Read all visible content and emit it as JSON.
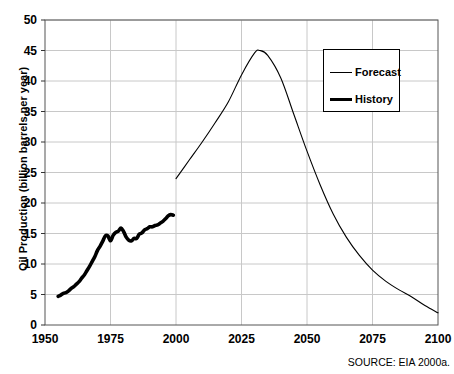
{
  "chart_data": {
    "type": "line",
    "title": "",
    "xlabel": "",
    "ylabel": "Oil Production (billion barrels per year)",
    "xlim": [
      1950,
      2100
    ],
    "ylim": [
      0,
      50
    ],
    "grid": true,
    "xticks": [
      "1950",
      "1975",
      "2000",
      "2025",
      "2050",
      "2075",
      "2100"
    ],
    "yticks": [
      "0",
      "5",
      "10",
      "15",
      "20",
      "25",
      "30",
      "35",
      "40",
      "45",
      "50"
    ],
    "xtick_values": [
      1950,
      1975,
      2000,
      2025,
      2050,
      2075,
      2100
    ],
    "ytick_values": [
      0,
      5,
      10,
      15,
      20,
      25,
      30,
      35,
      40,
      45,
      50
    ],
    "legend_position": "upper right",
    "annotation": "SOURCE: EIA 2000a.",
    "line_color": "#000000",
    "grid_color": "#c8c8c8",
    "axis_color": "#555555",
    "series": [
      {
        "name": "History",
        "style": "thick",
        "width": 3.6,
        "x": [
          1955,
          1956,
          1957,
          1958,
          1959,
          1960,
          1961,
          1962,
          1963,
          1964,
          1965,
          1966,
          1967,
          1968,
          1969,
          1970,
          1971,
          1972,
          1973,
          1974,
          1975,
          1976,
          1977,
          1978,
          1979,
          1980,
          1981,
          1982,
          1983,
          1984,
          1985,
          1986,
          1987,
          1988,
          1989,
          1990,
          1991,
          1992,
          1993,
          1994,
          1995,
          1996,
          1997,
          1998,
          1999
        ],
        "values": [
          4.7,
          4.9,
          5.2,
          5.3,
          5.6,
          6.0,
          6.3,
          6.7,
          7.1,
          7.7,
          8.2,
          8.9,
          9.6,
          10.4,
          11.2,
          12.2,
          12.9,
          13.7,
          14.6,
          14.6,
          13.8,
          14.7,
          15.2,
          15.4,
          15.9,
          15.3,
          14.4,
          13.9,
          13.8,
          14.2,
          14.2,
          14.9,
          15.1,
          15.6,
          15.8,
          16.1,
          16.1,
          16.3,
          16.4,
          16.7,
          17.0,
          17.4,
          17.9,
          18.1,
          18.0
        ],
        "description": "Historical oil production 1955-1999, rising from about 5 to about 24 billion barrels per year, with dips at the 1973-75 and 1979-83 oil shocks."
      },
      {
        "name": "Forecast",
        "style": "thin",
        "width": 1.1,
        "x": [
          2000,
          2005,
          2010,
          2015,
          2020,
          2025,
          2030,
          2032,
          2035,
          2040,
          2045,
          2050,
          2055,
          2060,
          2065,
          2070,
          2075,
          2080,
          2085,
          2090,
          2095,
          2100
        ],
        "values": [
          24.0,
          27.0,
          30.0,
          33.2,
          36.6,
          41.0,
          44.6,
          45.0,
          44.2,
          40.5,
          34.5,
          28.5,
          23.0,
          18.2,
          14.4,
          11.4,
          9.0,
          7.2,
          5.8,
          4.6,
          3.2,
          2.0
        ],
        "description": "Forecast oil production 2000-2100 peaking near 45 billion barrels per year around 2031 then declining to about 2 by 2100."
      }
    ]
  },
  "legend": {
    "items": [
      {
        "label": "Forecast",
        "style": "thin"
      },
      {
        "label": "History",
        "style": "thick"
      }
    ]
  },
  "footer": {
    "source": "SOURCE: EIA 2000a."
  }
}
